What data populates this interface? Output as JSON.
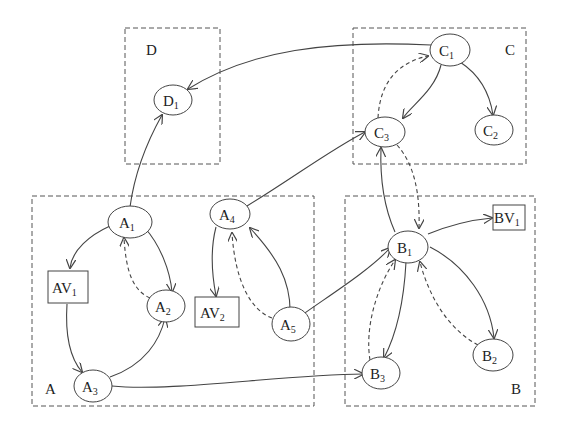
{
  "regions": [
    {
      "id": "D",
      "label": "D"
    },
    {
      "id": "C",
      "label": "C"
    },
    {
      "id": "A",
      "label": "A"
    },
    {
      "id": "B",
      "label": "B"
    }
  ],
  "nodes": {
    "D1": {
      "base": "D",
      "sub": "1"
    },
    "C1": {
      "base": "C",
      "sub": "1"
    },
    "C2": {
      "base": "C",
      "sub": "2"
    },
    "C3": {
      "base": "C",
      "sub": "3"
    },
    "A1": {
      "base": "A",
      "sub": "1"
    },
    "A2": {
      "base": "A",
      "sub": "2"
    },
    "A3": {
      "base": "A",
      "sub": "3"
    },
    "A4": {
      "base": "A",
      "sub": "4"
    },
    "A5": {
      "base": "A",
      "sub": "5"
    },
    "AV1": {
      "base": "AV",
      "sub": "1"
    },
    "AV2": {
      "base": "AV",
      "sub": "2"
    },
    "B1": {
      "base": "B",
      "sub": "1"
    },
    "B2": {
      "base": "B",
      "sub": "2"
    },
    "B3": {
      "base": "B",
      "sub": "3"
    },
    "BV1": {
      "base": "BV",
      "sub": "1"
    }
  },
  "edges": [
    {
      "from": "C1",
      "to": "D1",
      "style": "solid"
    },
    {
      "from": "A1",
      "to": "D1",
      "style": "solid"
    },
    {
      "from": "C1",
      "to": "C3",
      "style": "solid"
    },
    {
      "from": "C1",
      "to": "C2",
      "style": "solid"
    },
    {
      "from": "C3",
      "to": "C1",
      "style": "dashed"
    },
    {
      "from": "C3",
      "to": "B1",
      "style": "dashed"
    },
    {
      "from": "B1",
      "to": "C3",
      "style": "solid"
    },
    {
      "from": "A4",
      "to": "C3",
      "style": "solid"
    },
    {
      "from": "A1",
      "to": "AV1",
      "style": "solid"
    },
    {
      "from": "A1",
      "to": "A2",
      "style": "solid"
    },
    {
      "from": "A2",
      "to": "A1",
      "style": "dashed"
    },
    {
      "from": "AV1",
      "to": "A3",
      "style": "solid"
    },
    {
      "from": "A3",
      "to": "A2",
      "style": "solid"
    },
    {
      "from": "A3",
      "to": "B3",
      "style": "solid"
    },
    {
      "from": "A4",
      "to": "AV2",
      "style": "solid"
    },
    {
      "from": "A5",
      "to": "A4",
      "style": "solid"
    },
    {
      "from": "A5",
      "to": "A4",
      "style": "dashed"
    },
    {
      "from": "A5",
      "to": "B1",
      "style": "solid"
    },
    {
      "from": "B1",
      "to": "BV1",
      "style": "solid"
    },
    {
      "from": "B1",
      "to": "B2",
      "style": "solid"
    },
    {
      "from": "B2",
      "to": "B1",
      "style": "dashed"
    },
    {
      "from": "B1",
      "to": "B3",
      "style": "solid"
    },
    {
      "from": "B3",
      "to": "B1",
      "style": "dashed"
    }
  ]
}
